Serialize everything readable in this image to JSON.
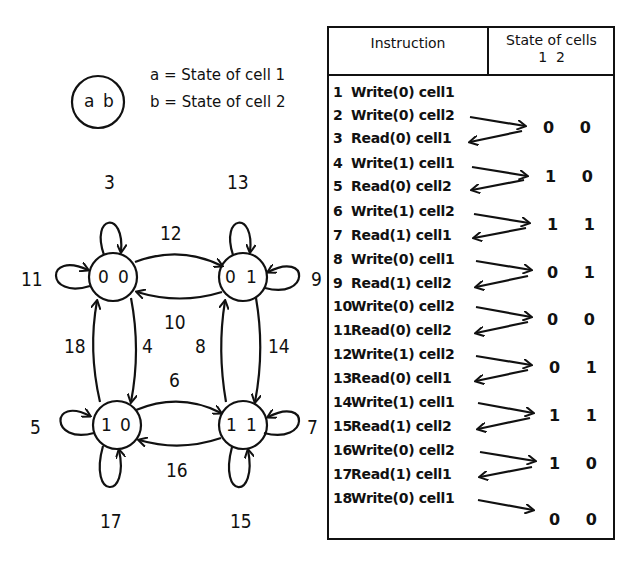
{
  "legend": {
    "node_sample": {
      "a": "a",
      "b": "b"
    },
    "lines": [
      "a = State of cell 1",
      "b = State of cell 2"
    ]
  },
  "state_diagram": {
    "nodes": [
      {
        "id": "00",
        "label_a": "0",
        "label_b": "0"
      },
      {
        "id": "01",
        "label_a": "0",
        "label_b": "1"
      },
      {
        "id": "10",
        "label_a": "1",
        "label_b": "0"
      },
      {
        "id": "11",
        "label_a": "1",
        "label_b": "1"
      }
    ],
    "edges": [
      {
        "from": "00",
        "to": "00",
        "label": "3"
      },
      {
        "from": "00",
        "to": "00",
        "label": "11"
      },
      {
        "from": "01",
        "to": "01",
        "label": "13"
      },
      {
        "from": "01",
        "to": "01",
        "label": "9"
      },
      {
        "from": "00",
        "to": "01",
        "label": "12"
      },
      {
        "from": "01",
        "to": "00",
        "label": "10"
      },
      {
        "from": "10",
        "to": "00",
        "label": "18"
      },
      {
        "from": "00",
        "to": "10",
        "label": "4"
      },
      {
        "from": "11",
        "to": "01",
        "label": "8"
      },
      {
        "from": "01",
        "to": "11",
        "label": "14"
      },
      {
        "from": "10",
        "to": "11",
        "label": "6"
      },
      {
        "from": "11",
        "to": "10",
        "label": "16"
      },
      {
        "from": "10",
        "to": "10",
        "label": "5"
      },
      {
        "from": "10",
        "to": "10",
        "label": "17"
      },
      {
        "from": "11",
        "to": "11",
        "label": "7"
      },
      {
        "from": "11",
        "to": "11",
        "label": "15"
      }
    ]
  },
  "table": {
    "header": {
      "instruction": "Instruction",
      "state": "State of cells",
      "state_cols": "1  2"
    },
    "rows": [
      {
        "num": "1",
        "text": "Write(0) cell1"
      },
      {
        "num": "2",
        "text": "Write(0) cell2"
      },
      {
        "num": "3",
        "text": "Read(0) cell1"
      },
      {
        "num": "4",
        "text": "Write(1) cell1"
      },
      {
        "num": "5",
        "text": "Read(0) cell2"
      },
      {
        "num": "6",
        "text": "Write(1) cell2"
      },
      {
        "num": "7",
        "text": "Read(1) cell1"
      },
      {
        "num": "8",
        "text": "Write(0) cell1"
      },
      {
        "num": "9",
        "text": "Read(1) cell2"
      },
      {
        "num": "10",
        "text": "Write(0) cell2"
      },
      {
        "num": "11",
        "text": "Read(0) cell2"
      },
      {
        "num": "12",
        "text": "Write(1) cell2"
      },
      {
        "num": "13",
        "text": "Read(0) cell1"
      },
      {
        "num": "14",
        "text": "Write(1) cell1"
      },
      {
        "num": "15",
        "text": "Read(1) cell2"
      },
      {
        "num": "16",
        "text": "Write(0) cell2"
      },
      {
        "num": "17",
        "text": "Read(1) cell1"
      },
      {
        "num": "18",
        "text": "Write(0) cell1"
      }
    ],
    "states": [
      "0 0",
      "1 0",
      "1 1",
      "0 1",
      "0 0",
      "0 1",
      "1 1",
      "1 0",
      "0 0"
    ]
  }
}
